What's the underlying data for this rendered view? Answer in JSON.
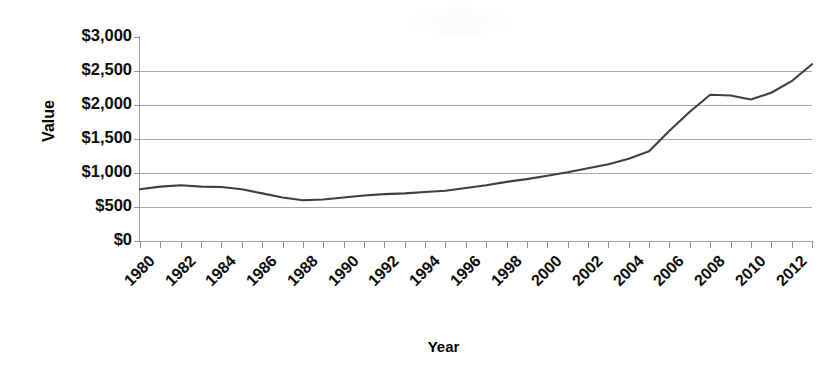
{
  "chart_data": {
    "type": "line",
    "title": "",
    "xlabel": "Year",
    "ylabel": "Value",
    "grid": true,
    "legend": "none",
    "xlim": [
      1980,
      2013
    ],
    "ylim": [
      0,
      3000
    ],
    "y_ticks": [
      0,
      500,
      1000,
      1500,
      2000,
      2500,
      3000
    ],
    "y_tick_labels": [
      "$0",
      "$500",
      "$1,000",
      "$1,500",
      "$2,000",
      "$2,500",
      "$3,000"
    ],
    "x_tick_labels": [
      "1980",
      "1982",
      "1984",
      "1986",
      "1988",
      "1990",
      "1992",
      "1994",
      "1996",
      "1998",
      "2000",
      "2002",
      "2004",
      "2006",
      "2008",
      "2010",
      "2012"
    ],
    "x_minor_tick_years": [
      1980,
      1981,
      1982,
      1983,
      1984,
      1985,
      1986,
      1987,
      1988,
      1989,
      1990,
      1991,
      1992,
      1993,
      1994,
      1995,
      1996,
      1997,
      1998,
      1999,
      2000,
      2001,
      2002,
      2003,
      2004,
      2005,
      2006,
      2007,
      2008,
      2009,
      2010,
      2011,
      2012,
      2013
    ],
    "series": [
      {
        "name": "Value",
        "color": "#3f3f3f",
        "x": [
          1980,
          1981,
          1982,
          1983,
          1984,
          1985,
          1986,
          1987,
          1988,
          1989,
          1990,
          1991,
          1992,
          1993,
          1994,
          1995,
          1996,
          1997,
          1998,
          1999,
          2000,
          2001,
          2002,
          2003,
          2004,
          2005,
          2006,
          2007,
          2008,
          2009,
          2010,
          2011,
          2012,
          2013
        ],
        "values": [
          760,
          800,
          820,
          800,
          795,
          760,
          700,
          640,
          600,
          610,
          640,
          670,
          690,
          700,
          720,
          740,
          780,
          820,
          870,
          910,
          960,
          1010,
          1070,
          1130,
          1210,
          1320,
          1620,
          1900,
          2150,
          2140,
          2080,
          2180,
          2350,
          2600
        ]
      }
    ]
  },
  "axis": {
    "y_title": "Value",
    "x_title": "Year"
  }
}
